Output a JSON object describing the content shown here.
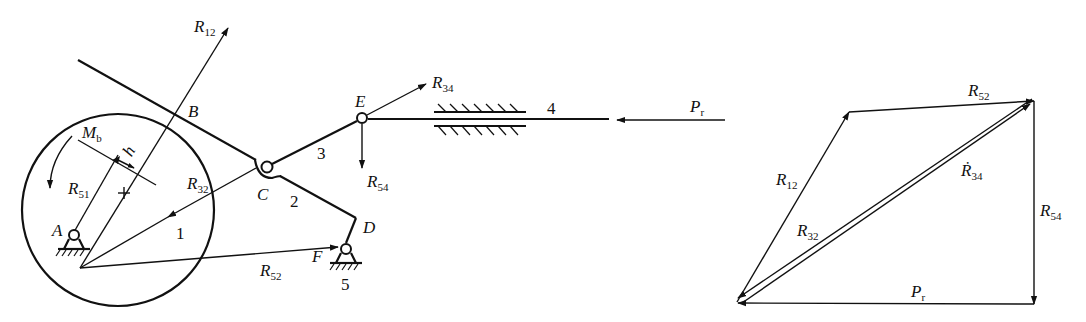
{
  "mechanism": {
    "points": {
      "A": "A",
      "B": "B",
      "C": "C",
      "D": "D",
      "E": "E",
      "F": "F"
    },
    "links": {
      "l1": "1",
      "l2": "2",
      "l3": "3",
      "l4": "4",
      "l5": "5"
    },
    "labels": {
      "R12": {
        "main": "R",
        "sub": "12"
      },
      "R34": {
        "main": "R",
        "sub": "34"
      },
      "R32": {
        "main": "R",
        "sub": "32"
      },
      "R51": {
        "main": "R",
        "sub": "51"
      },
      "R52": {
        "main": "R",
        "sub": "52"
      },
      "R54": {
        "main": "R",
        "sub": "54"
      },
      "Mb": {
        "main": "M",
        "sub": "b"
      },
      "h": "h",
      "Pr": {
        "main": "P",
        "sub": "r"
      }
    }
  },
  "force_polygon": {
    "labels": {
      "R52": {
        "main": "R",
        "sub": "52"
      },
      "R12": {
        "main": "R",
        "sub": "12"
      },
      "R34": {
        "main": "Ṙ",
        "sub": "34"
      },
      "R32": {
        "main": "R",
        "sub": "32"
      },
      "R54": {
        "main": "R",
        "sub": "54"
      },
      "Pr": {
        "main": "P",
        "sub": "r"
      }
    }
  }
}
